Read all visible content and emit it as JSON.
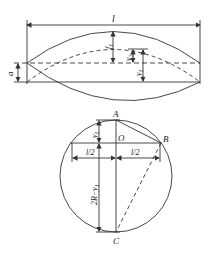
{
  "top_figure": {
    "span_label": "l",
    "offset_label": "a",
    "sag_label": "f1",
    "y1_label": "y",
    "y1_sub": "1",
    "y2_label": "y",
    "y2_sub": "2",
    "f_label": "f",
    "f_sub": "1"
  },
  "bottom_figure": {
    "point_a": "A",
    "point_b": "B",
    "point_c": "C",
    "point_o": "O",
    "half_span_left": "l/2",
    "half_span_right": "l/2",
    "y1_label": "y",
    "y1_sub": "1",
    "chord_label": "2R−y",
    "chord_sub": "1"
  },
  "colors": {
    "line": "#333333",
    "background": "#ffffff"
  }
}
